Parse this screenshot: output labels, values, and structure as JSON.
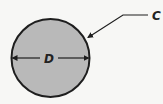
{
  "diagram": {
    "shape": "circle",
    "fill_color": "#b9b9b9",
    "stroke_color": "#1e1e1e",
    "labels": {
      "diameter": "D",
      "circumference": "C"
    }
  }
}
